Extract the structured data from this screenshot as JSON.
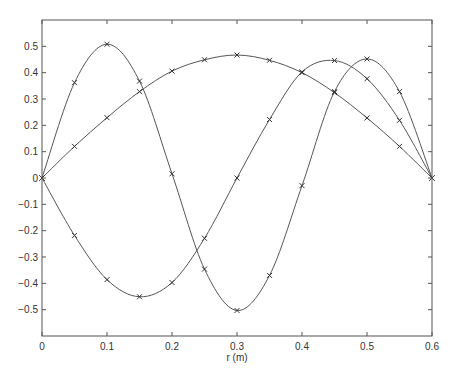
{
  "chart_data": {
    "type": "line",
    "title": "",
    "xlabel": "r (m)",
    "ylabel": "",
    "xlim": [
      0,
      0.6
    ],
    "ylim": [
      -0.6,
      0.6
    ],
    "grid": false,
    "legend": null,
    "marker": "x",
    "x_ticks": [
      0,
      0.1,
      0.2,
      0.3,
      0.4,
      0.5,
      0.6
    ],
    "x_tick_labels": [
      "0",
      "0.1",
      "0.2",
      "0.3",
      "0.4",
      "0.5",
      "0.6"
    ],
    "y_ticks": [
      -0.5,
      -0.4,
      -0.3,
      -0.2,
      -0.1,
      0,
      0.1,
      0.2,
      0.3,
      0.4,
      0.5
    ],
    "y_tick_labels": [
      "-0.5",
      "-0.4",
      "-0.3",
      "-0.2",
      "-0.1",
      "0",
      "0.1",
      "0.2",
      "0.3",
      "0.4",
      "0.5"
    ],
    "x": [
      0,
      0.05,
      0.1,
      0.15,
      0.2,
      0.25,
      0.3,
      0.35,
      0.4,
      0.45,
      0.5,
      0.55,
      0.6
    ],
    "series": [
      {
        "name": "mode 1",
        "values": [
          0,
          0.12,
          0.229,
          0.328,
          0.406,
          0.449,
          0.467,
          0.447,
          0.4,
          0.324,
          0.228,
          0.12,
          0
        ]
      },
      {
        "name": "mode 2",
        "values": [
          0,
          -0.218,
          -0.386,
          -0.451,
          -0.397,
          -0.229,
          0,
          0.222,
          0.403,
          0.446,
          0.377,
          0.219,
          0
        ]
      },
      {
        "name": "mode 3",
        "values": [
          0,
          0.362,
          0.508,
          0.368,
          0.016,
          -0.346,
          -0.503,
          -0.37,
          -0.029,
          0.328,
          0.452,
          0.328,
          0
        ]
      }
    ]
  }
}
